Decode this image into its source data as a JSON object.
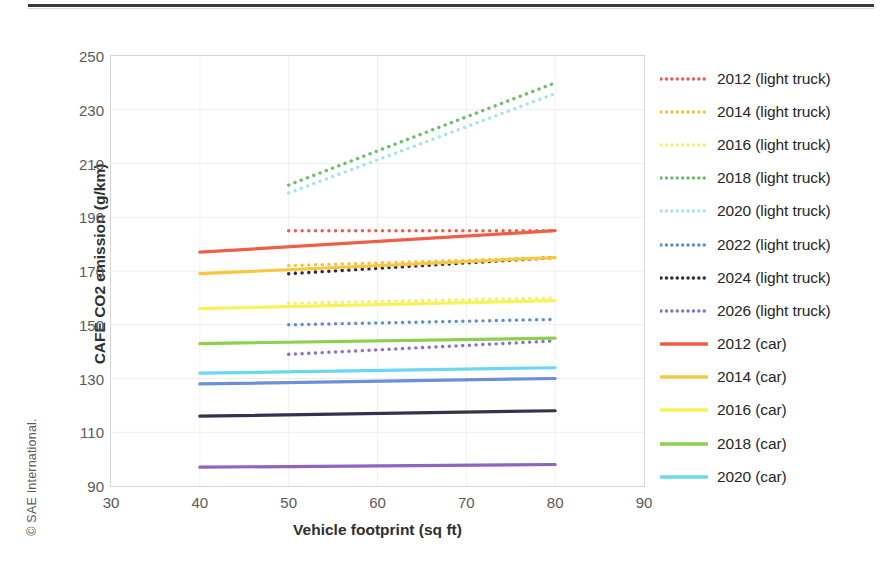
{
  "copyright": "© SAE International.",
  "axes": {
    "y_title": "CAFE CO2 emission (g/km)",
    "x_title": "Vehicle footprint (sq ft)",
    "y_ticks": [
      "250",
      "230",
      "210",
      "190",
      "170",
      "150",
      "130",
      "110",
      "90"
    ],
    "x_ticks": [
      "30",
      "40",
      "50",
      "60",
      "70",
      "80",
      "90"
    ]
  },
  "legend": {
    "items": [
      {
        "label": "2012 (light truck)",
        "color": "#E8604C",
        "style": "dotted"
      },
      {
        "label": "2014 (light truck)",
        "color": "#F5C242",
        "style": "dotted"
      },
      {
        "label": "2016 (light truck)",
        "color": "#F2EE6E",
        "style": "dotted"
      },
      {
        "label": "2018 (light truck)",
        "color": "#6FBE6A",
        "style": "dotted"
      },
      {
        "label": "2020 (light truck)",
        "color": "#A8E2F0",
        "style": "dotted"
      },
      {
        "label": "2022 (light truck)",
        "color": "#5B8FD4",
        "style": "dotted"
      },
      {
        "label": "2024 (light truck)",
        "color": "#2B2B45",
        "style": "dotted"
      },
      {
        "label": "2026 (light truck)",
        "color": "#8D6FC4",
        "style": "dotted"
      },
      {
        "label": "2012 (car)",
        "color": "#EF5F47",
        "style": "solid"
      },
      {
        "label": "2014 (car)",
        "color": "#F7C73F",
        "style": "solid"
      },
      {
        "label": "2016 (car)",
        "color": "#F7F258",
        "style": "solid"
      },
      {
        "label": "2018 (car)",
        "color": "#8BD14F",
        "style": "solid"
      },
      {
        "label": "2020 (car)",
        "color": "#6BD7F0",
        "style": "solid"
      }
    ]
  },
  "chart_data": {
    "type": "line",
    "title": "",
    "xlabel": "Vehicle footprint (sq ft)",
    "ylabel": "CAFE CO2 emission (g/km)",
    "xlim": [
      30,
      90
    ],
    "ylim": [
      90,
      250
    ],
    "xticks": [
      30,
      40,
      50,
      60,
      70,
      80,
      90
    ],
    "yticks": [
      90,
      110,
      130,
      150,
      170,
      190,
      210,
      230,
      250
    ],
    "grid": true,
    "legend_position": "right",
    "series": [
      {
        "name": "2012 (light truck)",
        "style": "dotted",
        "color": "#E8604C",
        "x": [
          50,
          80
        ],
        "y": [
          185,
          185
        ]
      },
      {
        "name": "2014 (light truck)",
        "style": "dotted",
        "color": "#F5C242",
        "x": [
          50,
          80
        ],
        "y": [
          172,
          175
        ]
      },
      {
        "name": "2016 (light truck)",
        "style": "dotted",
        "color": "#F2EE6E",
        "x": [
          50,
          80
        ],
        "y": [
          158,
          160
        ]
      },
      {
        "name": "2018 (light truck)",
        "style": "dotted",
        "color": "#6FBE6A",
        "x": [
          50,
          80
        ],
        "y": [
          202,
          240
        ]
      },
      {
        "name": "2020 (light truck)",
        "style": "dotted",
        "color": "#A8E2F0",
        "x": [
          50,
          80
        ],
        "y": [
          199,
          236
        ]
      },
      {
        "name": "2022 (light truck)",
        "style": "dotted",
        "color": "#5B8FD4",
        "x": [
          50,
          80
        ],
        "y": [
          150,
          152
        ]
      },
      {
        "name": "2024 (light truck)",
        "style": "dotted",
        "color": "#2B2B45",
        "x": [
          50,
          80
        ],
        "y": [
          169,
          175
        ]
      },
      {
        "name": "2026 (light truck)",
        "style": "dotted",
        "color": "#8D6FC4",
        "x": [
          50,
          80
        ],
        "y": [
          139,
          144
        ]
      },
      {
        "name": "2012 (car)",
        "style": "solid",
        "color": "#EF5F47",
        "x": [
          40,
          80
        ],
        "y": [
          177,
          185
        ]
      },
      {
        "name": "2014 (car)",
        "style": "solid",
        "color": "#F7C73F",
        "x": [
          40,
          80
        ],
        "y": [
          169,
          175
        ]
      },
      {
        "name": "2016 (car)",
        "style": "solid",
        "color": "#F7F258",
        "x": [
          40,
          80
        ],
        "y": [
          156,
          159
        ]
      },
      {
        "name": "2018 (car)",
        "style": "solid",
        "color": "#8BD14F",
        "x": [
          40,
          80
        ],
        "y": [
          143,
          145
        ]
      },
      {
        "name": "2020 (car)",
        "style": "solid",
        "color": "#6BD7F0",
        "x": [
          40,
          80
        ],
        "y": [
          132,
          134
        ]
      },
      {
        "name": "2022 (car)",
        "style": "solid",
        "color": "#6C8FD8",
        "x": [
          40,
          80
        ],
        "y": [
          128,
          130
        ]
      },
      {
        "name": "2024 (car)",
        "style": "solid",
        "color": "#33334F",
        "x": [
          40,
          80
        ],
        "y": [
          116,
          118
        ]
      },
      {
        "name": "2026 (car)",
        "style": "solid",
        "color": "#8F63C1",
        "x": [
          40,
          80
        ],
        "y": [
          97,
          98
        ]
      }
    ]
  }
}
